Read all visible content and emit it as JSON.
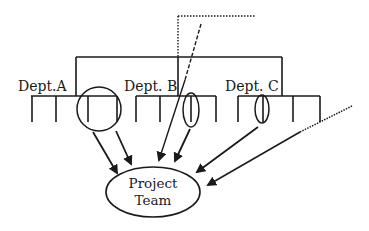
{
  "diagram": {
    "type": "org-chart-to-project-team",
    "departments": [
      {
        "label": "Dept.A"
      },
      {
        "label": "Dept. B"
      },
      {
        "label": "Dept. C"
      }
    ],
    "project_team": {
      "line1": "Project",
      "line2": "Team"
    },
    "colors": {
      "stroke": "#1a1a1a",
      "background": "#ffffff"
    }
  }
}
